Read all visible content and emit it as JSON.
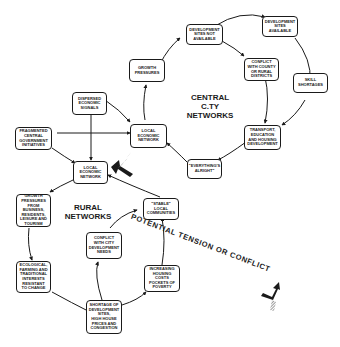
{
  "diagram": {
    "regions": {
      "central": "CENTRAL\nC.TY\nNETWORKS",
      "rural": "RURAL\nNETWORKS"
    },
    "tension_label": "POTENTIAL TENSION OR CONFLICT",
    "nodes": {
      "dev_sites_not_available": "DEVELOPMENT\nSITES NOT\nAVAILABLE",
      "dev_sites_available": "DEVELOPMENT\nSITES\nAVAILABLE",
      "growth_pressures": "GROWTH\nPRESSURES",
      "conflict_county": "CONFLICT\nWITH COUNTY\nOR RURAL\nDISTRICTS",
      "skill_shortages": "SKILL\nSHORTAGES",
      "dispersed_signals": "DISPERSED\nECONOMIC\nSIGNALS",
      "local_econ_central": "LOCAL\nECONOMIC\nNETWORK",
      "transport": "TRANSPORT,\nEDUCATION\nAND HOUSING\nDEVELOPMENT",
      "fragmented_gov": "FRAGMENTED\nCENTRAL\nGOVERNMENT\nINITIATIVES",
      "everythings_alright": "\"EVERYTHING'S\nALRIGHT\"",
      "local_econ_rural": "LOCAL\nECONOMIC\nNETWORK",
      "growth_rural": "GROWTH\nPRESSURES\nFROM BUSINESS,\nRESIDENTS,\nLEISURE AND\nTOURISM",
      "stable_communities": "\"STABLE\"\nLOCAL\nCOMMUNITIES",
      "conflict_city": "CONFLICT\nWITH CITY\nDEVELOPMENT\nNEEDS",
      "ecological": "ECOLOGICAL,\nFARMING AND\nTRADITIONAL\nINTERESTS\nRESISTANT\nTO CHANGE",
      "increasing_housing": "INCREASING\nHOUSING COSTS\nPOCKETS OF\nPOVERTY",
      "shortage_sites": "SHORTAGE OF\nDEVELOPMENT\nSITES,\nHIGH HOUSE\nPRICES AND\nCONGESTION"
    },
    "colors": {
      "ink": "#1a1a1a",
      "background": "#ffffff",
      "hatch": "#9a9a9a"
    }
  }
}
